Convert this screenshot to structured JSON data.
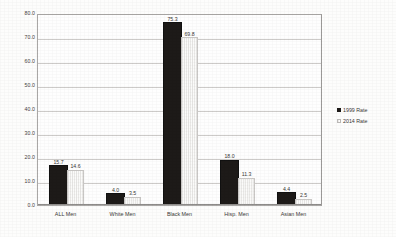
{
  "chart_data": {
    "type": "bar",
    "title": "",
    "subtitle": "",
    "xlabel": "",
    "ylabel": "",
    "ylim": [
      0.0,
      80.0
    ],
    "ytick_labels": [
      "80.0",
      "70.0",
      "60.0",
      "50.0",
      "40.0",
      "30.0",
      "20.0",
      "10.0",
      "0.0"
    ],
    "ytick_values": [
      80.0,
      70.0,
      60.0,
      50.0,
      40.0,
      30.0,
      20.0,
      10.0,
      0.0
    ],
    "grid": true,
    "legend_position": "right",
    "categories": [
      "ALL Men",
      "White Men",
      "Black Men",
      "Hisp. Men",
      "Asian Men"
    ],
    "series": [
      {
        "name": "1999 Rate",
        "color": "#1d1a18",
        "values": [
          15.7,
          4.0,
          75.3,
          18.0,
          4.4
        ],
        "labels": [
          "15.7",
          "4.0",
          "75.3",
          "18.0",
          "4.4"
        ]
      },
      {
        "name": "2014 Rate",
        "color": "#e9e8e6",
        "values": [
          14.6,
          3.5,
          69.8,
          11.3,
          2.5
        ],
        "labels": [
          "14.6",
          "3.5",
          "69.8",
          "11.3",
          "2.5"
        ]
      }
    ]
  },
  "legend": {
    "items": [
      {
        "label": "1999 Rate"
      },
      {
        "label": "2014 Rate"
      }
    ]
  }
}
